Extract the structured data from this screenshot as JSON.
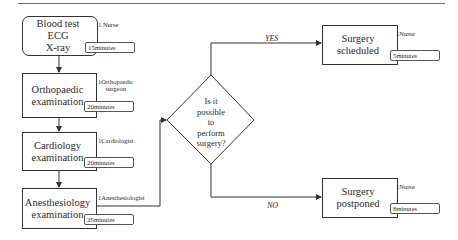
{
  "steps": [
    {
      "label_lines": [
        "Blood test",
        "ECG",
        "X-ray"
      ],
      "staff": "Nurse",
      "count": "1",
      "duration": "15",
      "unit": "minutes"
    },
    {
      "label_lines": [
        "Orthopaedic",
        "examination"
      ],
      "staff_lines": [
        "Orthopaedic",
        "surgeon"
      ],
      "count": "1",
      "duration": "20",
      "unit": "minutes"
    },
    {
      "label_lines": [
        "Cardiology",
        "examination"
      ],
      "staff": "Cardiologist",
      "count": "1",
      "duration": "20",
      "unit": "minutes"
    },
    {
      "label_lines": [
        "Anesthesiology",
        "examination"
      ],
      "staff": "Anesthesiologist",
      "count": "1",
      "duration": "25",
      "unit": "minutes"
    }
  ],
  "decision": {
    "lines": [
      "Is it",
      "possible",
      "to",
      "perform",
      "surgery?"
    ]
  },
  "outcomes": {
    "yes": {
      "edge_label": "YES",
      "label": "Surgery scheduled",
      "staff": "Nurse",
      "count": "1",
      "duration": "5",
      "unit": "minutes"
    },
    "no": {
      "edge_label": "NO",
      "label": "Surgery postponed",
      "staff": "Nurse",
      "count": "1",
      "duration": "8",
      "unit": "minutes"
    }
  }
}
